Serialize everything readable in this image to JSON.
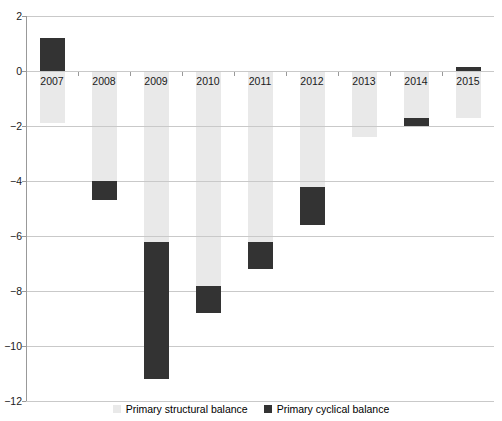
{
  "chart_data": {
    "type": "bar",
    "stacked": true,
    "title": "",
    "xlabel": "",
    "ylabel": "",
    "categories": [
      "2007",
      "2008",
      "2009",
      "2010",
      "2011",
      "2012",
      "2013",
      "2014",
      "2015"
    ],
    "series": [
      {
        "name": "Primary structural balance",
        "color": "#e9e9e9",
        "values": [
          -1.9,
          -4.0,
          -6.2,
          -7.8,
          -6.2,
          -4.2,
          -2.4,
          -1.7,
          -1.7
        ]
      },
      {
        "name": "Primary cyclical balance",
        "color": "#333333",
        "values": [
          1.2,
          -0.7,
          -5.0,
          -1.0,
          -1.0,
          -1.4,
          0,
          -0.3,
          0.15
        ]
      }
    ],
    "ylim": [
      -12,
      2
    ],
    "ytick_values": [
      2,
      0,
      -2,
      -4,
      -6,
      -8,
      -10,
      -12
    ],
    "ytick_labels": [
      "2",
      "0",
      "−2",
      "−4",
      "−6",
      "−8",
      "−10",
      "−12"
    ],
    "grid": true,
    "legend_position": "bottom"
  },
  "colors": {
    "background": "#ffffff",
    "gridline": "#c9c9c9",
    "axis": "#999999",
    "text": "#1a1a1a",
    "structural": "#e9e9e9",
    "cyclical": "#333333"
  }
}
